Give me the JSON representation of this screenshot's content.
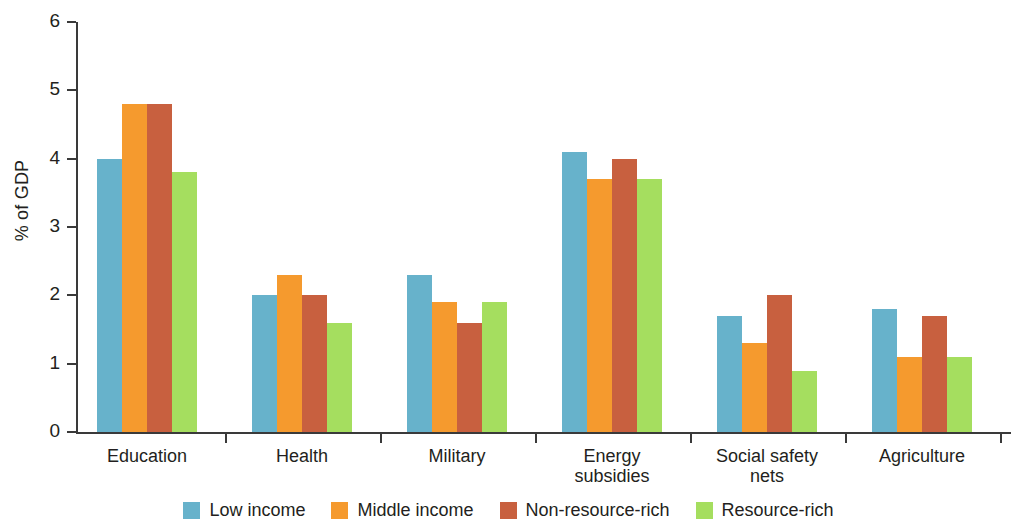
{
  "chart_data": {
    "type": "bar",
    "title": "",
    "subtitle": "",
    "xlabel": "",
    "ylabel": "% of GDP",
    "ylim": [
      0,
      6
    ],
    "yticks": [
      0,
      1,
      2,
      3,
      4,
      5,
      6
    ],
    "ytick_labels": [
      "0",
      "1",
      "2",
      "3",
      "4",
      "5",
      "6"
    ],
    "grid": false,
    "legend_position": "bottom",
    "categories": [
      "Education",
      "Health",
      "Military",
      "Energy\nsubsidies",
      "Social safety\nnets",
      "Agriculture"
    ],
    "series": [
      {
        "name": "Low income",
        "color": "#67b2cb",
        "values": [
          4.0,
          2.0,
          2.3,
          4.1,
          1.7,
          1.8
        ]
      },
      {
        "name": "Middle income",
        "color": "#f59a2e",
        "values": [
          4.8,
          2.3,
          1.9,
          3.7,
          1.3,
          1.1
        ]
      },
      {
        "name": "Non-resource-rich",
        "color": "#c8603f",
        "values": [
          4.8,
          2.0,
          1.6,
          4.0,
          2.0,
          1.7
        ]
      },
      {
        "name": "Resource-rich",
        "color": "#a5de5f",
        "values": [
          3.8,
          1.6,
          1.9,
          3.7,
          0.9,
          1.1
        ]
      }
    ]
  },
  "axis": {
    "label_color": "#231f20",
    "line_color": "#3a3a3a"
  }
}
